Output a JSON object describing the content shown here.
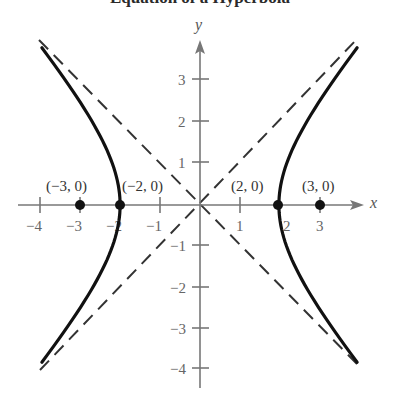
{
  "title": "Equation of a Hyperbola",
  "diagram": {
    "type": "hyperbola",
    "equation_params": {
      "a": 2,
      "b_squared": 5,
      "c": 3,
      "center": [
        0,
        0
      ]
    },
    "axes": {
      "x_label": "x",
      "y_label": "y",
      "x_ticks": [
        "−4",
        "−3",
        "−2",
        "−1",
        "1",
        "2",
        "3"
      ],
      "y_ticks": [
        "3",
        "2",
        "1",
        "−1",
        "−2",
        "−3",
        "−4"
      ]
    },
    "points": [
      {
        "label": "(−3, 0)",
        "x": -3,
        "y": 0,
        "role": "focus"
      },
      {
        "label": "(−2, 0)",
        "x": -2,
        "y": 0,
        "role": "vertex"
      },
      {
        "label": "(2, 0)",
        "x": 2,
        "y": 0,
        "role": "vertex"
      },
      {
        "label": "(3, 0)",
        "x": 3,
        "y": 0,
        "role": "focus"
      }
    ],
    "asymptotes": "dashed lines through origin",
    "colors": {
      "curve": "#111111",
      "axis": "#777777",
      "asymptote": "#333333",
      "point": "#111111"
    }
  }
}
